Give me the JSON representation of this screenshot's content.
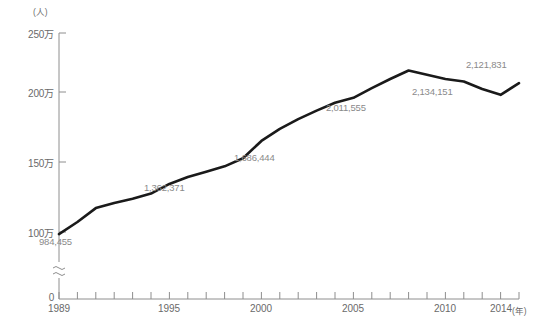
{
  "chart_data": {
    "type": "line",
    "title": "",
    "xlabel": "年",
    "ylabel": "人",
    "y_unit_label": "(人)",
    "x_unit_label": "(年)",
    "grid": false,
    "legend": "none",
    "axis_break": true,
    "ylim": [
      950000,
      2500000
    ],
    "y_ticks": [
      {
        "value": 0,
        "label": "0"
      },
      {
        "value": 1000000,
        "label": "100万"
      },
      {
        "value": 1500000,
        "label": "150万"
      },
      {
        "value": 2000000,
        "label": "200万"
      },
      {
        "value": 2500000,
        "label": "250万"
      }
    ],
    "x_ticks": [
      {
        "value": 1989,
        "label": "1989"
      },
      {
        "value": 1995,
        "label": "1995"
      },
      {
        "value": 2000,
        "label": "2000"
      },
      {
        "value": 2005,
        "label": "2005"
      },
      {
        "value": 2010,
        "label": "2010"
      },
      {
        "value": 2014,
        "label": "2014"
      }
    ],
    "xlim": [
      1989,
      2014
    ],
    "x": [
      1989,
      1990,
      1991,
      1992,
      1993,
      1994,
      1995,
      1996,
      1997,
      1998,
      1999,
      2000,
      2001,
      2002,
      2003,
      2004,
      2005,
      2006,
      2007,
      2008,
      2009,
      2010,
      2011,
      2012,
      2013,
      2014
    ],
    "values": [
      984455,
      1075317,
      1180000,
      1218891,
      1250000,
      1290000,
      1362371,
      1415000,
      1455000,
      1495000,
      1556000,
      1686444,
      1778000,
      1851000,
      1915000,
      1974000,
      2011555,
      2085000,
      2153000,
      2217000,
      2186000,
      2153000,
      2134151,
      2078000,
      2034000,
      2121831
    ],
    "series": [
      {
        "name": "外国人登録者数",
        "color": "#1a1a1a",
        "values": [
          984455,
          1075317,
          1180000,
          1218891,
          1250000,
          1290000,
          1362371,
          1415000,
          1455000,
          1495000,
          1556000,
          1686444,
          1778000,
          1851000,
          1915000,
          1974000,
          2011555,
          2085000,
          2153000,
          2217000,
          2186000,
          2153000,
          2134151,
          2078000,
          2034000,
          2121831
        ]
      }
    ],
    "annotations": [
      {
        "label": "984,455",
        "x": 1989,
        "value": 984455
      },
      {
        "label": "1,362,371",
        "x": 1995,
        "value": 1362371
      },
      {
        "label": "1,686,444",
        "x": 2000,
        "value": 1686444
      },
      {
        "label": "2,011,555",
        "x": 2005,
        "value": 2011555
      },
      {
        "label": "2,134,151",
        "x": 2011,
        "value": 2134151
      },
      {
        "label": "2,121,831",
        "x": 2014,
        "value": 2121831
      }
    ]
  },
  "footnote": {
    "text": ""
  }
}
